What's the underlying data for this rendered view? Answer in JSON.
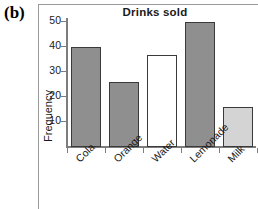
{
  "figure": {
    "panel_label": "(b)"
  },
  "chart_data": {
    "type": "bar",
    "title": "Drinks sold",
    "xlabel": "",
    "ylabel": "Frequency",
    "categories": [
      "Cola",
      "Orange",
      "Water",
      "Lemonade",
      "Milk"
    ],
    "values": [
      40,
      26,
      37,
      50,
      16
    ],
    "bar_colors": [
      "#8f8f8f",
      "#8f8f8f",
      "#ffffff",
      "#8f8f8f",
      "#d4d4d4"
    ],
    "bar_edge_color": "#3a3a3a",
    "ylim": [
      0,
      52
    ],
    "yticks": [
      10,
      20,
      30,
      40,
      50
    ],
    "ytick_labels": [
      "10",
      "20",
      "30",
      "40",
      "50"
    ],
    "grid": false,
    "legend": false
  },
  "colors": {
    "axis": "#7d7d7d",
    "text": "#1a1a1a",
    "panel_border": "#9a9a9a"
  }
}
